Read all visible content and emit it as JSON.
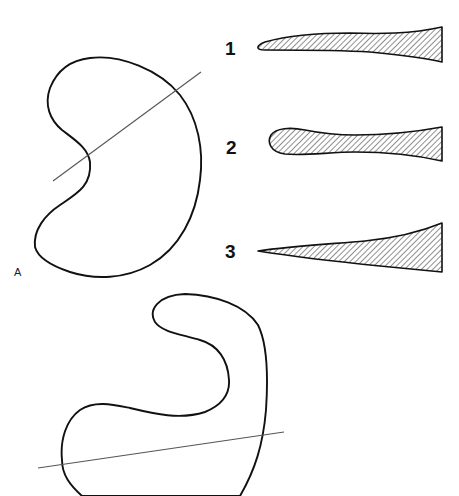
{
  "figure": {
    "panel_label": "A",
    "cross_sections": [
      {
        "label": "1",
        "description": "flat blade profile with rounded tip"
      },
      {
        "label": "2",
        "description": "bulbous rounded tip profile"
      },
      {
        "label": "3",
        "description": "pointed wedge profile"
      }
    ],
    "outlines": [
      {
        "name": "kidney-outline",
        "has_section_line": true
      },
      {
        "name": "hook-outline",
        "has_section_line": true
      }
    ],
    "colors": {
      "stroke": "#111111",
      "section_line": "#555555",
      "hatch": "#222222",
      "background": "#ffffff"
    }
  }
}
